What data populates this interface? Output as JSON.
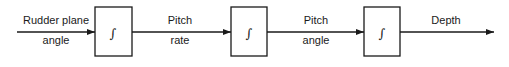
{
  "diagram": {
    "type": "block-diagram",
    "input": {
      "line1": "Rudder plane",
      "line2": "angle"
    },
    "blocks": [
      {
        "id": "integrator-1",
        "symbol": "∫"
      },
      {
        "id": "integrator-2",
        "symbol": "∫"
      },
      {
        "id": "integrator-3",
        "symbol": "∫"
      }
    ],
    "signals": [
      {
        "line1": "Pitch",
        "line2": "rate"
      },
      {
        "line1": "Pitch",
        "line2": "angle"
      }
    ],
    "output": {
      "label": "Depth"
    },
    "colors": {
      "stroke": "#1a1a1a",
      "background": "#ffffff"
    }
  }
}
